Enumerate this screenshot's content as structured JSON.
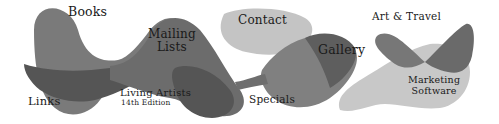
{
  "nav": {
    "books": "Books",
    "mailing_lists": [
      "Mailing",
      "Lists"
    ],
    "contact": "Contact",
    "art_travel": "Art & Travel",
    "gallery": "Gallery",
    "links": "Links",
    "living_artists": [
      "Living Artists",
      "14th Edition"
    ],
    "specials": "Specials",
    "marketing_software": [
      "Marketing",
      "Software"
    ]
  },
  "colors": {
    "dark_gray": "#555555",
    "mid_gray": "#808080",
    "light_gray": "#c4c4c4",
    "text": "#1a1a1a",
    "background": "#ffffff"
  }
}
